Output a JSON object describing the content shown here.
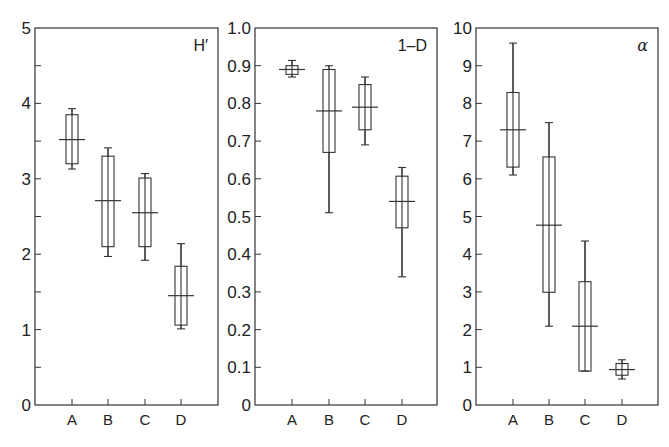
{
  "chart_data": [
    {
      "type": "box",
      "panel_label": "H′",
      "title": "",
      "xlabel": "",
      "ylabel": "",
      "ylim": [
        0,
        5
      ],
      "yticks": [
        0,
        1,
        2,
        3,
        4,
        5
      ],
      "yticks_minor": [
        0.5,
        1.5,
        2.5,
        3.5,
        4.5
      ],
      "ytick_labels": [
        "0",
        "1",
        "2",
        "3",
        "4",
        "5"
      ],
      "categories": [
        "A",
        "B",
        "C",
        "D"
      ],
      "series": [
        {
          "category": "A",
          "whisker_low": 3.13,
          "q1": 3.2,
          "median": 3.52,
          "q3": 3.85,
          "whisker_high": 3.93
        },
        {
          "category": "B",
          "whisker_low": 1.97,
          "q1": 2.1,
          "median": 2.71,
          "q3": 3.3,
          "whisker_high": 3.41
        },
        {
          "category": "C",
          "whisker_low": 1.92,
          "q1": 2.1,
          "median": 2.55,
          "q3": 3.01,
          "whisker_high": 3.07
        },
        {
          "category": "D",
          "whisker_low": 1.01,
          "q1": 1.06,
          "median": 1.45,
          "q3": 1.84,
          "whisker_high": 2.14
        }
      ],
      "grid": false,
      "legend": null
    },
    {
      "type": "box",
      "panel_label": "1–D",
      "title": "",
      "xlabel": "",
      "ylabel": "",
      "ylim": [
        0,
        1.0
      ],
      "yticks": [
        0,
        0.1,
        0.2,
        0.3,
        0.4,
        0.5,
        0.6,
        0.7,
        0.8,
        0.9,
        1.0
      ],
      "yticks_minor": [],
      "ytick_labels": [
        "0",
        "0.1",
        "0.2",
        "0.3",
        "0.4",
        "0.5",
        "0.6",
        "0.7",
        "0.8",
        "0.9",
        "1.0"
      ],
      "categories": [
        "A",
        "B",
        "C",
        "D"
      ],
      "series": [
        {
          "category": "A",
          "whisker_low": 0.87,
          "q1": 0.877,
          "median": 0.89,
          "q3": 0.9,
          "whisker_high": 0.914
        },
        {
          "category": "B",
          "whisker_low": 0.51,
          "q1": 0.67,
          "median": 0.78,
          "q3": 0.89,
          "whisker_high": 0.9
        },
        {
          "category": "C",
          "whisker_low": 0.69,
          "q1": 0.73,
          "median": 0.79,
          "q3": 0.85,
          "whisker_high": 0.87
        },
        {
          "category": "D",
          "whisker_low": 0.34,
          "q1": 0.47,
          "median": 0.54,
          "q3": 0.607,
          "whisker_high": 0.63
        }
      ],
      "grid": false,
      "legend": null
    },
    {
      "type": "box",
      "panel_label": "α",
      "title": "",
      "xlabel": "",
      "ylabel": "",
      "ylim": [
        0,
        10
      ],
      "yticks": [
        0,
        1,
        2,
        3,
        4,
        5,
        6,
        7,
        8,
        9,
        10
      ],
      "yticks_minor": [],
      "ytick_labels": [
        "0",
        "1",
        "2",
        "3",
        "4",
        "5",
        "6",
        "7",
        "8",
        "9",
        "10"
      ],
      "categories": [
        "A",
        "B",
        "C",
        "D"
      ],
      "series": [
        {
          "category": "A",
          "whisker_low": 6.1,
          "q1": 6.31,
          "median": 7.3,
          "q3": 8.29,
          "whisker_high": 9.6
        },
        {
          "category": "B",
          "whisker_low": 2.09,
          "q1": 2.99,
          "median": 4.77,
          "q3": 6.58,
          "whisker_high": 7.49
        },
        {
          "category": "C",
          "whisker_low": 0.9,
          "q1": 0.9,
          "median": 2.09,
          "q3": 3.27,
          "whisker_high": 4.35
        },
        {
          "category": "D",
          "whisker_low": 0.69,
          "q1": 0.79,
          "median": 0.94,
          "q3": 1.1,
          "whisker_high": 1.2
        }
      ],
      "grid": false,
      "legend": null
    }
  ],
  "layout": {
    "panels": [
      {
        "left": 35,
        "right": 218,
        "top": 28,
        "bottom": 405,
        "xticks": [
          72,
          108,
          145,
          181
        ],
        "label_italic": false
      },
      {
        "left": 255,
        "right": 437,
        "top": 28,
        "bottom": 405,
        "xticks": [
          292,
          329,
          365,
          402
        ],
        "label_italic": false
      },
      {
        "left": 476,
        "right": 658,
        "top": 28,
        "bottom": 405,
        "xticks": [
          513,
          549,
          585,
          622
        ],
        "label_italic": true
      }
    ],
    "box_half_width": 6,
    "median_half_width": 13,
    "cap_half_width": 4,
    "stroke_color": "#333333"
  }
}
